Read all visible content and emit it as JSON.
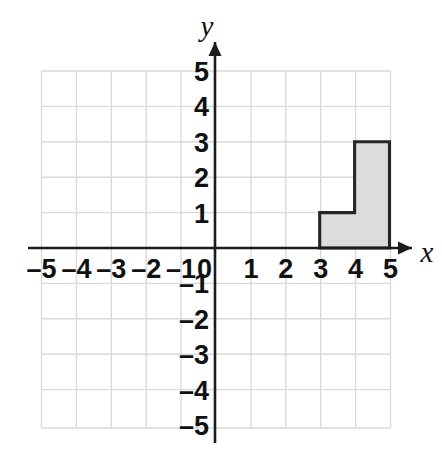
{
  "figure": {
    "name": "coordinate-plane-with-shaded-step-figure",
    "background_color": "#ffffff"
  },
  "axes": {
    "x_label": "x",
    "y_label": "y",
    "axis_color": "#1c1c1c",
    "grid_color": "#dadada",
    "x_ticks": [
      "–5",
      "–4",
      "–3",
      "–2",
      "–1",
      "1",
      "2",
      "3",
      "4",
      "5"
    ],
    "y_ticks": [
      "5",
      "4",
      "3",
      "2",
      "1",
      "–1",
      "–2",
      "–3",
      "–4",
      "–5"
    ],
    "origin_label": "0"
  },
  "chart_data": {
    "type": "scatter",
    "title": "",
    "xlabel": "x",
    "ylabel": "y",
    "xlim": [
      -5,
      5
    ],
    "ylim": [
      -5,
      5
    ],
    "x_ticks": [
      -5,
      -4,
      -3,
      -2,
      -1,
      0,
      1,
      2,
      3,
      4,
      5
    ],
    "y_ticks": [
      -5,
      -4,
      -3,
      -2,
      -1,
      0,
      1,
      2,
      3,
      4,
      5
    ],
    "grid": true,
    "legend": "none",
    "shapes": [
      {
        "name": "shaded-step-polygon",
        "kind": "polygon",
        "fill_color": "#dcdcdc",
        "stroke_color": "#262626",
        "vertices": [
          [
            3,
            0
          ],
          [
            3,
            1
          ],
          [
            4,
            1
          ],
          [
            4,
            3
          ],
          [
            5,
            3
          ],
          [
            5,
            0
          ]
        ]
      }
    ]
  }
}
